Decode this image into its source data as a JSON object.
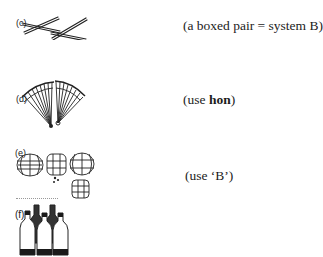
{
  "items": [
    {
      "label": "(c)",
      "picture": "chopsticks-pair",
      "note_prefix": "(a boxed pair = system B)",
      "note_bold": "",
      "note_suffix": ""
    },
    {
      "label": "(d)",
      "picture": "folding-fans-pair",
      "note_prefix": "(use ",
      "note_bold": "hon",
      "note_suffix": ")"
    },
    {
      "label": "(e)",
      "picture": "paper-lanterns",
      "note_prefix": "(use ‘B’)",
      "note_bold": "",
      "note_suffix": ""
    },
    {
      "label": "(f)",
      "picture": "bottles",
      "note_prefix": "",
      "note_bold": "",
      "note_suffix": ""
    }
  ]
}
